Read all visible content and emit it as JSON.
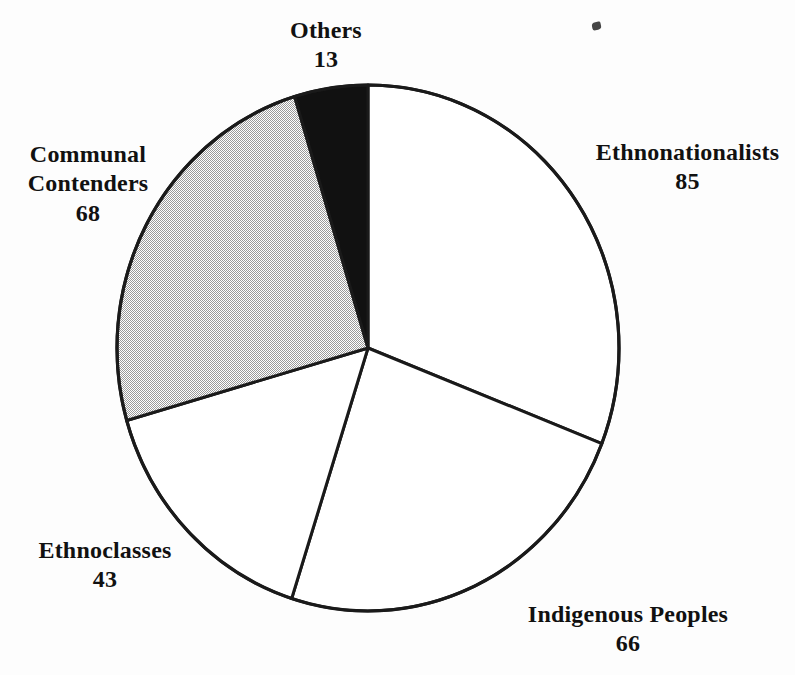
{
  "chart_data": {
    "type": "pie",
    "title": "",
    "subtitle": "",
    "xlabel": "",
    "ylabel": "",
    "total": 275,
    "start_angle_deg": 0,
    "direction": "clockwise",
    "legend_position": "none",
    "labels_outside": true,
    "grid": false,
    "categories": [
      "Ethnonationalists",
      "Indigenous Peoples",
      "Ethnoclasses",
      "Communal Contenders",
      "Others"
    ],
    "values": [
      85,
      66,
      43,
      68,
      13
    ],
    "slices": [
      {
        "name": "Ethnonationalists",
        "value": 85,
        "value_text": "85",
        "fill": "white",
        "color": "#ffffff",
        "start_deg": 0.0,
        "end_deg": 111.3,
        "sweep_deg": 111.3,
        "percent": 30.9,
        "label_position": "right"
      },
      {
        "name": "Indigenous Peoples",
        "value": 66,
        "value_text": "66",
        "fill": "white",
        "color": "#ffffff",
        "start_deg": 111.3,
        "end_deg": 197.7,
        "sweep_deg": 86.4,
        "percent": 24.0,
        "label_position": "bottom-right"
      },
      {
        "name": "Ethnoclasses",
        "value": 43,
        "value_text": "43",
        "fill": "white",
        "color": "#ffffff",
        "start_deg": 197.7,
        "end_deg": 254.0,
        "sweep_deg": 56.3,
        "percent": 15.6,
        "label_position": "bottom-left"
      },
      {
        "name": "Communal Contenders",
        "value": 68,
        "value_text": "68",
        "fill": "gray-halftone",
        "color": "#cccccc",
        "start_deg": 254.0,
        "end_deg": 343.0,
        "sweep_deg": 89.0,
        "percent": 24.7,
        "label_position": "left"
      },
      {
        "name": "Others",
        "value": 13,
        "value_text": "13",
        "fill": "black",
        "color": "#111111",
        "start_deg": 343.0,
        "end_deg": 360.0,
        "sweep_deg": 17.0,
        "percent": 4.7,
        "label_position": "top"
      }
    ]
  },
  "labels": {
    "others": {
      "line1": "Others",
      "value": "13"
    },
    "ethnonationalists": {
      "line1": "Ethnonationalists",
      "value": "85"
    },
    "communal": {
      "line1": "Communal",
      "line2": "Contenders",
      "value": "68"
    },
    "ethnoclasses": {
      "line1": "Ethnoclasses",
      "value": "43"
    },
    "indigenous": {
      "line1": "Indigenous Peoples",
      "value": "66"
    }
  },
  "style": {
    "background": "#fdfdfd",
    "outline_color": "#1a1a1a",
    "black_slice_color": "#111111",
    "gray_slice_color": "#cccccc",
    "white_slice_color": "#ffffff",
    "text_color": "#111111"
  }
}
